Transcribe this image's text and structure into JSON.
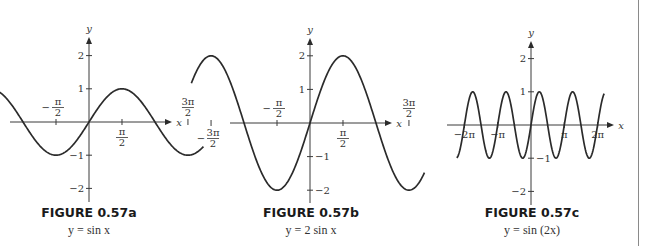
{
  "chart_data": [
    {
      "type": "line",
      "title": "FIGURE 0.57a",
      "subtitle": "y = sin x",
      "function": "sin",
      "amplitude": 1,
      "frequency": 1,
      "xlabel": "x",
      "ylabel": "y",
      "xlim": [
        -4.5,
        4.5
      ],
      "ylim": [
        -2.5,
        2.5
      ],
      "x_ticks": [
        {
          "value": -4.712,
          "label_num": "3π",
          "label_den": "2",
          "sign": "−",
          "label_pos": "below"
        },
        {
          "value": -1.571,
          "label_num": "π",
          "label_den": "2",
          "sign": "−",
          "label_pos": "above"
        },
        {
          "value": 1.571,
          "label_num": "π",
          "label_den": "2",
          "sign": "",
          "label_pos": "below"
        },
        {
          "value": 4.712,
          "label_num": "3π",
          "label_den": "2",
          "sign": "",
          "label_pos": "above"
        }
      ],
      "y_ticks": [
        {
          "value": 2,
          "label": "2",
          "side": "left"
        },
        {
          "value": 1,
          "label": "1",
          "side": "left"
        },
        {
          "value": -1,
          "label": "−1",
          "side": "left"
        },
        {
          "value": -2,
          "label": "−2",
          "side": "left"
        }
      ],
      "curve_x_range": [
        -5.65,
        5.45
      ],
      "grid": false
    },
    {
      "type": "line",
      "title": "FIGURE 0.57b",
      "subtitle": "y = 2 sin x",
      "function": "sin",
      "amplitude": 2,
      "frequency": 1,
      "xlabel": "x",
      "ylabel": "y",
      "xlim": [
        -4.5,
        4.5
      ],
      "ylim": [
        -2.5,
        2.5
      ],
      "x_ticks": [
        {
          "value": -4.712,
          "label_num": "3π",
          "label_den": "2",
          "sign": "−",
          "label_pos": "below"
        },
        {
          "value": -1.571,
          "label_num": "π",
          "label_den": "2",
          "sign": "−",
          "label_pos": "above"
        },
        {
          "value": 1.571,
          "label_num": "π",
          "label_den": "2",
          "sign": "",
          "label_pos": "below"
        },
        {
          "value": 4.712,
          "label_num": "3π",
          "label_den": "2",
          "sign": "",
          "label_pos": "above"
        }
      ],
      "y_ticks": [
        {
          "value": 2,
          "label": "2",
          "side": "left"
        },
        {
          "value": 1,
          "label": "1",
          "side": "left"
        },
        {
          "value": -1,
          "label": "−1",
          "side": "right"
        },
        {
          "value": -2,
          "label": "−2",
          "side": "right"
        }
      ],
      "curve_x_range": [
        -5.65,
        5.45
      ],
      "grid": false
    },
    {
      "type": "line",
      "title": "FIGURE 0.57c",
      "subtitle": "y = sin (2x)",
      "function": "sin",
      "amplitude": 1,
      "frequency": 2,
      "xlabel": "x",
      "ylabel": "y",
      "xlim": [
        -7.5,
        7.5
      ],
      "ylim": [
        -2.5,
        2.5
      ],
      "x_ticks": [
        {
          "value": -6.283,
          "label": "−2π"
        },
        {
          "value": -3.142,
          "label": "−π"
        },
        {
          "value": 3.142,
          "label": "π"
        },
        {
          "value": 6.283,
          "label": "2π"
        }
      ],
      "y_ticks": [
        {
          "value": 2,
          "label": "2",
          "side": "left"
        },
        {
          "value": 1,
          "label": "1",
          "side": "left"
        },
        {
          "value": -1,
          "label": "−1",
          "side": "right"
        },
        {
          "value": -2,
          "label": "−2",
          "side": "left"
        }
      ],
      "curve_x_range": [
        -7.0,
        6.9
      ],
      "grid": false
    }
  ],
  "captions": [
    {
      "title": "FIGURE 0.57a",
      "equation": "y = sin x"
    },
    {
      "title": "FIGURE 0.57b",
      "equation": "y = 2 sin x"
    },
    {
      "title": "FIGURE 0.57c",
      "equation": "y = sin (2x)"
    }
  ],
  "colors": {
    "curve": "#2b2b2b",
    "axis": "#3a3a3a",
    "divider": "#8a8a8a"
  }
}
